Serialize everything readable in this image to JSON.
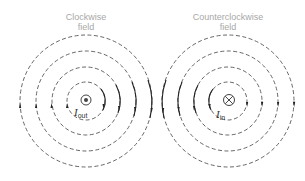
{
  "diagram": {
    "left_field": {
      "title_line1": "Clockwise",
      "title_line2": "field",
      "current_label": "I",
      "current_subscript": "out",
      "current_symbol": "dot-in-circle (out of page)",
      "direction": "clockwise",
      "center": [
        86,
        101
      ],
      "radii": [
        19,
        34,
        50,
        66
      ]
    },
    "right_field": {
      "title_line1": "Counterclockwise",
      "title_line2": "field",
      "current_label": "I",
      "current_subscript": "in",
      "current_symbol": "cross-in-circle (into page)",
      "direction": "counterclockwise",
      "center": [
        228,
        101
      ],
      "radii": [
        19,
        34,
        50,
        66
      ]
    },
    "colors": {
      "field_line": "#555555",
      "title_text": "#a8a8a8",
      "arrow": "#222222",
      "symbol": "#444444"
    }
  }
}
